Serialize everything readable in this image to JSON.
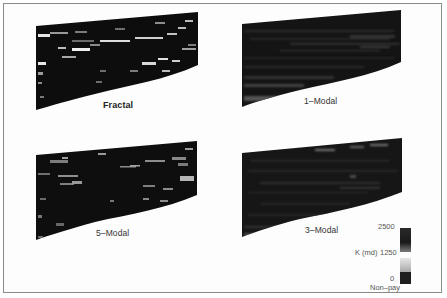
{
  "figure": {
    "panels": [
      {
        "id": "fractal",
        "label": "Fractal",
        "bold": true,
        "shape": {
          "tl": [
            36,
            26
          ],
          "tr": [
            198,
            12
          ],
          "br": [
            198,
            65
          ],
          "bl": [
            36,
            110
          ]
        },
        "label_pos": [
          103,
          101
        ],
        "texture": "dark with bright scattered lenses"
      },
      {
        "id": "1-modal",
        "label": "1–Modal",
        "bold": false,
        "shape": {
          "tl": [
            242,
            24
          ],
          "tr": [
            401,
            10
          ],
          "br": [
            401,
            62
          ],
          "bl": [
            242,
            107
          ]
        },
        "label_pos": [
          304,
          97
        ],
        "texture": "dark with faint continuous layering"
      },
      {
        "id": "5-modal",
        "label": "5–Modal",
        "bold": false,
        "shape": {
          "tl": [
            36,
            155
          ],
          "tr": [
            197,
            141
          ],
          "br": [
            197,
            195
          ],
          "bl": [
            36,
            240
          ]
        },
        "label_pos": [
          96,
          228
        ],
        "texture": "dark with medium scattered lenses"
      },
      {
        "id": "3-modal",
        "label": "3–Modal",
        "bold": false,
        "shape": {
          "tl": [
            242,
            153
          ],
          "tr": [
            402,
            138
          ],
          "br": [
            402,
            192
          ],
          "bl": [
            242,
            237
          ]
        },
        "label_pos": [
          305,
          226
        ],
        "texture": "dark with faint layering"
      }
    ],
    "legend": {
      "title": "K (md)",
      "ticks": [
        "2500",
        "1250",
        "0"
      ],
      "nonpay_label": "Non–pay",
      "colors": {
        "high": "#1a1a1a",
        "mid": "#6a6a6a",
        "low": "#cfcfcf",
        "nonpay": "#1e1e1e"
      }
    }
  }
}
